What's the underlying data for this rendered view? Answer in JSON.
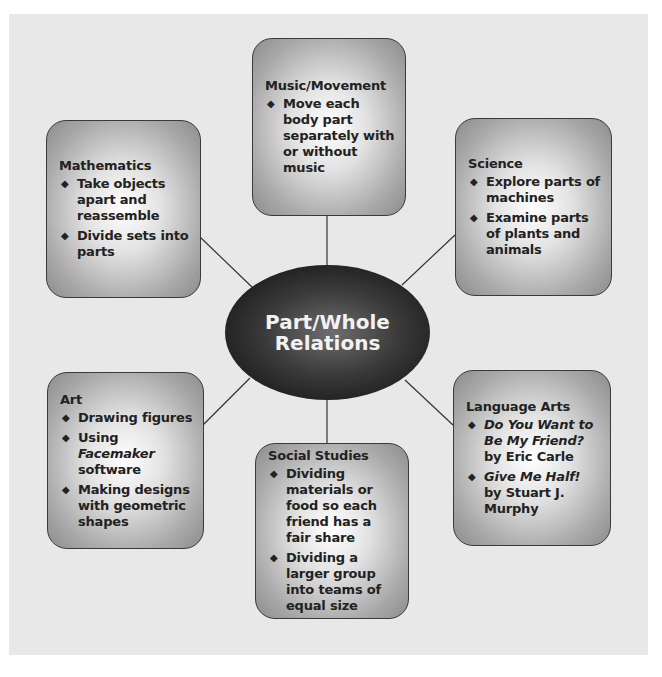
{
  "diagram": {
    "center": {
      "line1": "Part/Whole",
      "line2": "Relations"
    },
    "nodes": [
      {
        "id": "music",
        "title": "Music/Movement",
        "items": [
          {
            "pre": "",
            "italic": "",
            "post": "Move each body part separately with or without music"
          }
        ]
      },
      {
        "id": "mathematics",
        "title": "Mathematics",
        "items": [
          {
            "pre": "",
            "italic": "",
            "post": "Take objects apart and reassemble"
          },
          {
            "pre": "",
            "italic": "",
            "post": "Divide sets into parts"
          }
        ]
      },
      {
        "id": "science",
        "title": "Science",
        "items": [
          {
            "pre": "",
            "italic": "",
            "post": "Explore parts of machines"
          },
          {
            "pre": "",
            "italic": "",
            "post": "Examine parts of plants and animals"
          }
        ]
      },
      {
        "id": "art",
        "title": "Art",
        "items": [
          {
            "pre": "",
            "italic": "",
            "post": "Drawing figures"
          },
          {
            "pre": "Using ",
            "italic": "Facemaker",
            "post": " software"
          },
          {
            "pre": "",
            "italic": "",
            "post": "Making designs with geometric shapes"
          }
        ]
      },
      {
        "id": "social-studies",
        "title": "Social Studies",
        "items": [
          {
            "pre": "",
            "italic": "",
            "post": "Dividing materials or food so each friend has a fair share"
          },
          {
            "pre": "",
            "italic": "",
            "post": "Dividing a larger group into teams of equal size"
          }
        ]
      },
      {
        "id": "language-arts",
        "title": "Language Arts",
        "items": [
          {
            "pre": "",
            "italic": "Do You Want to Be My Friend?",
            "post": " by Eric Carle"
          },
          {
            "pre": "",
            "italic": "Give Me Half!",
            "post": " by Stuart J. Murphy"
          }
        ]
      }
    ],
    "bullet_glyph": "◆",
    "colors": {
      "background": "#e8e8e8",
      "box_edge": "#8c8c8c",
      "box_center": "#ffffff",
      "oval": "#1c1c1c",
      "oval_text": "#f2f2f2",
      "text": "#222222",
      "connector": "#333333"
    }
  }
}
